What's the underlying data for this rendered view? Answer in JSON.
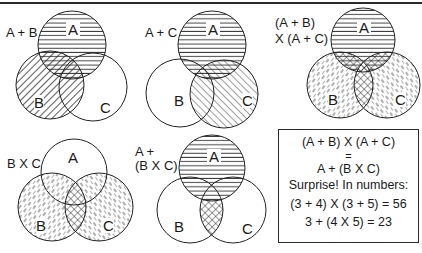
{
  "panels": [
    {
      "id": "a-plus-b",
      "label": "A + B",
      "circles": {
        "A": "A",
        "B": "B",
        "C": "C"
      },
      "shading": {
        "A": "horizontal",
        "B": "diagonal-back",
        "C": "none"
      }
    },
    {
      "id": "a-plus-c",
      "label": "A + C",
      "circles": {
        "A": "A",
        "B": "B",
        "C": "C"
      },
      "shading": {
        "A": "horizontal",
        "B": "none",
        "C": "diagonal-fwd"
      }
    },
    {
      "id": "ab-times-ac",
      "label_line1": "(A + B)",
      "label_line2": "X (A + C)",
      "circles": {
        "A": "A",
        "B": "B",
        "C": "C"
      },
      "shading": {
        "A": "horizontal",
        "B": "dashed-back",
        "C": "dashed-fwd",
        "overlap": "crosshatch"
      }
    },
    {
      "id": "b-times-c",
      "label": "B X C",
      "circles": {
        "A": "A",
        "B": "B",
        "C": "C"
      },
      "shading": {
        "A": "none",
        "B": "dashed-back",
        "C": "dashed-fwd",
        "overlap": "crosshatch"
      }
    },
    {
      "id": "a-plus-bc",
      "label_line1": "A +",
      "label_line2": "(B X C)",
      "circles": {
        "A": "A",
        "B": "B",
        "C": "C"
      },
      "shading": {
        "A": "horizontal",
        "B": "none",
        "C": "none",
        "overlap": "crosshatch"
      }
    }
  ],
  "summary_box": {
    "line1": "(A + B) X (A + C)",
    "line2": "=",
    "line3": "A + (B X C)",
    "line4": "Surprise!  In numbers:",
    "line5": "(3 + 4) X (3 + 5) =  56",
    "line6": "3 + (4 X 5) = 23"
  },
  "colors": {
    "ink": "#1a1a1a",
    "background": "#ffffff"
  }
}
